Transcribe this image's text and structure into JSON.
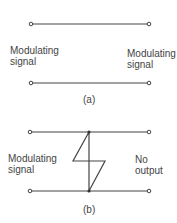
{
  "figure_a": {
    "left_label_line1": "Modulating",
    "left_label_line2": "signal",
    "right_label_line1": "Modulating",
    "right_label_line2": "signal",
    "caption": "(a)"
  },
  "figure_b": {
    "left_label_line1": "Modulating",
    "left_label_line2": "signal",
    "right_label_line1": "No",
    "right_label_line2": "output",
    "caption": "(b)"
  }
}
